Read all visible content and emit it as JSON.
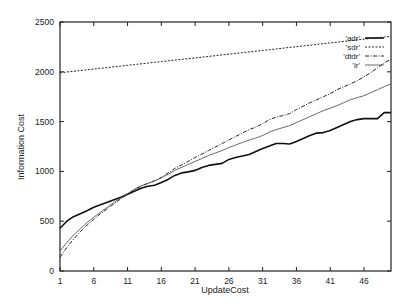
{
  "chart_data": {
    "type": "line",
    "title": "",
    "xlabel": "UpdateCost",
    "ylabel": "Information Cost",
    "xlim": [
      1,
      50
    ],
    "ylim": [
      0,
      2500
    ],
    "grid": false,
    "legend_position": "top-right-inside",
    "xticks": [
      1,
      6,
      11,
      16,
      21,
      26,
      31,
      36,
      41,
      46
    ],
    "yticks": [
      0,
      500,
      1000,
      1500,
      2000,
      2500
    ],
    "x": [
      1,
      2,
      3,
      4,
      5,
      6,
      7,
      8,
      9,
      10,
      11,
      12,
      13,
      14,
      15,
      16,
      17,
      18,
      19,
      20,
      21,
      22,
      23,
      24,
      25,
      26,
      27,
      28,
      29,
      30,
      31,
      32,
      33,
      34,
      35,
      36,
      37,
      38,
      39,
      40,
      41,
      42,
      43,
      44,
      45,
      46,
      47,
      48,
      49,
      50
    ],
    "series": [
      {
        "name": "'adr'",
        "style": "solid-thick",
        "values": [
          430,
          500,
          545,
          575,
          605,
          640,
          665,
          690,
          715,
          740,
          770,
          800,
          830,
          850,
          860,
          890,
          920,
          960,
          985,
          995,
          1010,
          1040,
          1060,
          1070,
          1080,
          1120,
          1140,
          1155,
          1170,
          1200,
          1230,
          1255,
          1280,
          1280,
          1275,
          1300,
          1330,
          1360,
          1385,
          1390,
          1410,
          1440,
          1470,
          1500,
          1520,
          1530,
          1530,
          1530,
          1590,
          1590
        ]
      },
      {
        "name": "'sdr'",
        "style": "dotted",
        "values": [
          1990,
          1998,
          2005,
          2012,
          2020,
          2027,
          2035,
          2042,
          2050,
          2057,
          2065,
          2072,
          2080,
          2087,
          2095,
          2102,
          2110,
          2117,
          2125,
          2132,
          2140,
          2147,
          2155,
          2162,
          2170,
          2177,
          2185,
          2192,
          2200,
          2207,
          2215,
          2222,
          2230,
          2237,
          2245,
          2252,
          2260,
          2267,
          2275,
          2282,
          2290,
          2297,
          2305,
          2312,
          2320,
          2327,
          2335,
          2342,
          2348,
          2355
        ]
      },
      {
        "name": "'dtdr'",
        "style": "dash-dot",
        "values": [
          140,
          235,
          320,
          395,
          460,
          520,
          575,
          625,
          675,
          725,
          770,
          815,
          850,
          880,
          905,
          940,
          985,
          1030,
          1065,
          1100,
          1140,
          1175,
          1210,
          1245,
          1280,
          1315,
          1350,
          1385,
          1420,
          1445,
          1480,
          1520,
          1545,
          1560,
          1580,
          1620,
          1655,
          1690,
          1720,
          1750,
          1780,
          1820,
          1850,
          1880,
          1910,
          1950,
          1990,
          2040,
          2090,
          2125
        ]
      },
      {
        "name": "'ir'",
        "style": "solid-thin",
        "values": [
          200,
          285,
          360,
          425,
          485,
          540,
          590,
          640,
          690,
          735,
          775,
          820,
          855,
          880,
          905,
          935,
          970,
          1010,
          1040,
          1070,
          1100,
          1130,
          1160,
          1185,
          1210,
          1240,
          1265,
          1290,
          1315,
          1335,
          1360,
          1395,
          1420,
          1440,
          1460,
          1490,
          1520,
          1550,
          1580,
          1610,
          1635,
          1660,
          1690,
          1720,
          1740,
          1760,
          1790,
          1820,
          1850,
          1880
        ]
      }
    ]
  },
  "axes": {
    "xlabel": "UpdateCost",
    "ylabel": "Information Cost"
  }
}
